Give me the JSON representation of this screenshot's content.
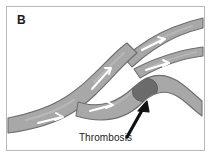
{
  "figure": {
    "panel_letter": "B",
    "caption": "Thrombosis",
    "background_color": "#ffffff",
    "frame_color": "#b9b9b9",
    "text_color": "#1a1a1a"
  },
  "vessel": {
    "fill_color": "#a8a8a8",
    "outline_color": "#6e6e6e",
    "lumen_highlight_color": "#bdbdbd",
    "flow_arrow_color": "#ffffff",
    "flow_arrow_label": "blood-flow-direction",
    "flow_arrow_count": 5,
    "description": "main trunk enters lower-left, ascends right, bifurcates into an upper Y-branch pair exiting right edge and a lower branch exiting right edge"
  },
  "thrombus": {
    "label": "Thrombosis",
    "fill_color": "#6b6b6b",
    "shape": "oval",
    "location": "lower right branch",
    "center_x": 139,
    "center_y": 84,
    "radius_x": 12,
    "radius_y": 9
  },
  "pointer": {
    "label": "thrombosis-pointer",
    "color": "#111111",
    "direction": "up-right",
    "tail_x": 121,
    "tail_y": 130,
    "tip_x": 140,
    "tip_y": 96
  }
}
